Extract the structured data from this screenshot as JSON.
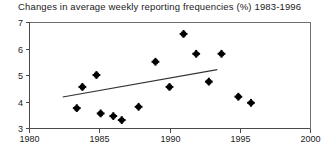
{
  "chart_data": {
    "type": "scatter",
    "title": "Changes in average weekly reporting frequencies (%) 1983-1996",
    "xlabel": "",
    "ylabel": "",
    "xlim": [
      1980,
      2000
    ],
    "ylim": [
      3,
      7
    ],
    "xticks": [
      1980,
      1985,
      1990,
      1995,
      2000
    ],
    "xtick_labels": [
      "1980",
      "1985",
      "1990",
      "1995",
      "2000"
    ],
    "yticks": [
      3,
      4,
      5,
      6,
      7
    ],
    "ytick_labels": [
      "3",
      "4",
      "5",
      "6",
      "7"
    ],
    "grid": false,
    "legend": "none",
    "points": [
      {
        "x": 1983.4,
        "y": 3.75
      },
      {
        "x": 1983.8,
        "y": 4.55
      },
      {
        "x": 1984.8,
        "y": 5.0
      },
      {
        "x": 1985.1,
        "y": 3.55
      },
      {
        "x": 1986.0,
        "y": 3.45
      },
      {
        "x": 1986.6,
        "y": 3.3
      },
      {
        "x": 1987.8,
        "y": 3.8
      },
      {
        "x": 1989.0,
        "y": 5.5
      },
      {
        "x": 1990.0,
        "y": 4.55
      },
      {
        "x": 1991.0,
        "y": 6.55
      },
      {
        "x": 1991.9,
        "y": 5.8
      },
      {
        "x": 1992.8,
        "y": 4.75
      },
      {
        "x": 1993.7,
        "y": 5.8
      },
      {
        "x": 1994.9,
        "y": 4.18
      },
      {
        "x": 1995.8,
        "y": 3.95
      }
    ],
    "trendline": {
      "name": "linear trend",
      "x0": 1982.4,
      "y0": 4.17,
      "x1": 1993.4,
      "y1": 5.2
    }
  },
  "plot_geometry": {
    "left": 29,
    "right": 310,
    "top": 22,
    "bottom": 128
  }
}
